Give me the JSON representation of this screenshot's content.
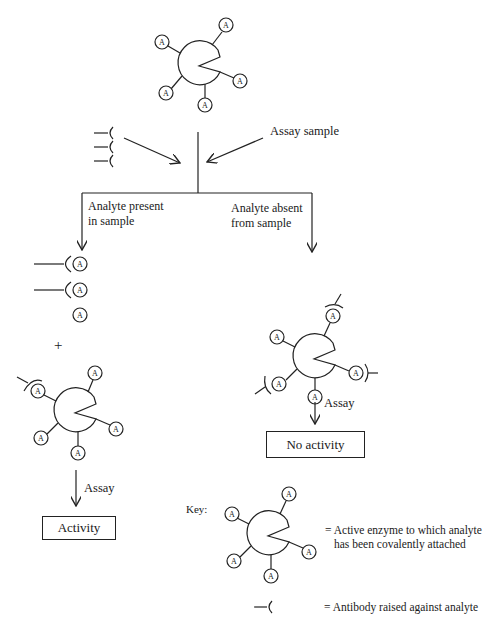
{
  "diagram": {
    "type": "enzyme-immunoassay-schematic",
    "analyte_symbol": "A",
    "labels": {
      "assay_sample": "Assay sample",
      "branch_present_line1": "Analyte present",
      "branch_present_line2": "in sample",
      "branch_absent_line1": "Analyte absent",
      "branch_absent_line2": "from sample",
      "plus": "+",
      "assay_left": "Assay",
      "assay_right": "Assay"
    },
    "outcomes": {
      "present": "Activity",
      "absent": "No activity"
    },
    "key": {
      "title": "Key:",
      "enzyme_line1": "= Active enzyme to which analyte",
      "enzyme_line2": "has been covalently attached",
      "antibody": "= Antibody raised against analyte"
    },
    "nodes": [
      {
        "id": "top-enzyme",
        "label": "Active enzyme with 5 analyte molecules attached"
      },
      {
        "id": "antibodies-input",
        "label": "3 free antibodies"
      },
      {
        "id": "present-bound-antibodies",
        "label": "2 antibody-analyte complexes and 1 free analyte"
      },
      {
        "id": "present-enzyme",
        "label": "Enzyme with 1 antibody bound (active)"
      },
      {
        "id": "absent-enzyme",
        "label": "Enzyme with 3 antibodies bound (inhibited)"
      }
    ],
    "colors": {
      "ink": "#222222",
      "background": "#ffffff"
    }
  }
}
